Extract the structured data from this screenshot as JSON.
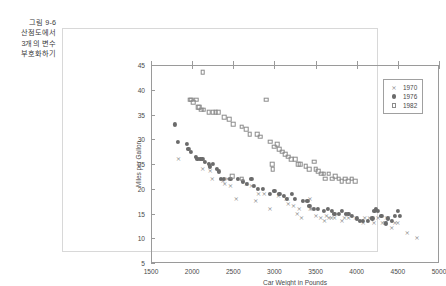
{
  "caption": {
    "lines": [
      "그림 9-6",
      "산점도에서",
      "3개의 변수",
      "부호화하기"
    ]
  },
  "colors": {
    "marker_1970": "#8b8b8b",
    "marker_1976": "#6b6b6b",
    "marker_1982": "#8b8b8b",
    "axis": "#9a9a9a",
    "frame": "#d8d8d8",
    "text": "#4a4a4a",
    "background": "#ffffff"
  },
  "legend": {
    "position": "top-right",
    "entries": [
      {
        "label": "1970",
        "marker": "cross-icon"
      },
      {
        "label": "1976",
        "marker": "filled-circle-icon"
      },
      {
        "label": "1982",
        "marker": "open-square-icon"
      }
    ]
  },
  "chart_data": {
    "type": "scatter",
    "title": "",
    "xlabel": "Car Weight in Pounds",
    "ylabel": "Miles per Gallon",
    "xlim": [
      1500,
      5000
    ],
    "ylim": [
      5,
      45
    ],
    "xticks": [
      1500,
      2000,
      2500,
      3000,
      3500,
      4000,
      4500,
      5000
    ],
    "yticks": [
      5,
      10,
      15,
      20,
      25,
      30,
      35,
      40,
      45
    ],
    "grid": false,
    "legend_position": "top-right",
    "series": [
      {
        "name": "1970",
        "marker": "cross-icon",
        "color": "#8b8b8b",
        "points": [
          [
            1835,
            26.0
          ],
          [
            2130,
            24.0
          ],
          [
            2220,
            23.5
          ],
          [
            2245,
            22.0
          ],
          [
            2375,
            21.5
          ],
          [
            2395,
            21.0
          ],
          [
            2425,
            22.0
          ],
          [
            2465,
            20.5
          ],
          [
            2535,
            18.0
          ],
          [
            2660,
            21.0
          ],
          [
            2720,
            20.5
          ],
          [
            2774,
            17.5
          ],
          [
            2807,
            19.0
          ],
          [
            2875,
            19.0
          ],
          [
            2945,
            16.0
          ],
          [
            3050,
            18.5
          ],
          [
            3139,
            18.0
          ],
          [
            3160,
            18.0
          ],
          [
            3169,
            17.0
          ],
          [
            3233,
            16.5
          ],
          [
            3278,
            15.0
          ],
          [
            3302,
            16.0
          ],
          [
            3329,
            14.0
          ],
          [
            3433,
            18.0
          ],
          [
            3436,
            16.0
          ],
          [
            3449,
            16.0
          ],
          [
            3504,
            14.5
          ],
          [
            3563,
            14.0
          ],
          [
            3609,
            13.5
          ],
          [
            3632,
            14.5
          ],
          [
            3664,
            14.0
          ],
          [
            3693,
            14.0
          ],
          [
            3730,
            14.0
          ],
          [
            3821,
            13.5
          ],
          [
            3850,
            14.0
          ],
          [
            3900,
            14.0
          ],
          [
            3988,
            14.0
          ],
          [
            4080,
            13.0
          ],
          [
            4096,
            14.0
          ],
          [
            4154,
            14.0
          ],
          [
            4209,
            13.0
          ],
          [
            4257,
            14.0
          ],
          [
            4312,
            13.0
          ],
          [
            4341,
            13.0
          ],
          [
            4354,
            13.0
          ],
          [
            4363,
            14.0
          ],
          [
            4385,
            14.0
          ],
          [
            4425,
            12.0
          ],
          [
            4464,
            13.0
          ],
          [
            4498,
            13.0
          ],
          [
            4615,
            11.0
          ],
          [
            4732,
            10.0
          ]
        ]
      },
      {
        "name": "1976",
        "marker": "filled-circle-icon",
        "color": "#6b6b6b",
        "points": [
          [
            1795,
            33.0
          ],
          [
            1825,
            29.5
          ],
          [
            1940,
            29.0
          ],
          [
            1955,
            28.0
          ],
          [
            1985,
            27.5
          ],
          [
            2045,
            26.5
          ],
          [
            2065,
            26.0
          ],
          [
            2100,
            26.0
          ],
          [
            2125,
            26.0
          ],
          [
            2155,
            25.5
          ],
          [
            2205,
            25.0
          ],
          [
            2220,
            24.5
          ],
          [
            2255,
            25.0
          ],
          [
            2300,
            24.0
          ],
          [
            2330,
            23.5
          ],
          [
            2350,
            22.0
          ],
          [
            2385,
            22.0
          ],
          [
            2465,
            22.0
          ],
          [
            2560,
            22.0
          ],
          [
            2620,
            21.5
          ],
          [
            2665,
            21.0
          ],
          [
            2720,
            22.0
          ],
          [
            2755,
            20.5
          ],
          [
            2800,
            20.0
          ],
          [
            2860,
            20.0
          ],
          [
            2945,
            19.0
          ],
          [
            3000,
            19.5
          ],
          [
            3060,
            19.0
          ],
          [
            3120,
            18.5
          ],
          [
            3155,
            18.0
          ],
          [
            3210,
            19.0
          ],
          [
            3250,
            18.0
          ],
          [
            3350,
            17.5
          ],
          [
            3400,
            17.5
          ],
          [
            3425,
            16.5
          ],
          [
            3475,
            16.0
          ],
          [
            3530,
            16.0
          ],
          [
            3605,
            15.5
          ],
          [
            3650,
            16.0
          ],
          [
            3700,
            15.5
          ],
          [
            3730,
            15.0
          ],
          [
            3785,
            15.0
          ],
          [
            3820,
            15.5
          ],
          [
            3870,
            15.0
          ],
          [
            3900,
            15.0
          ],
          [
            3940,
            14.5
          ],
          [
            4000,
            14.0
          ],
          [
            4042,
            13.5
          ],
          [
            4080,
            13.5
          ],
          [
            4135,
            13.5
          ],
          [
            4190,
            14.0
          ],
          [
            4215,
            15.5
          ],
          [
            4237,
            16.0
          ],
          [
            4260,
            15.5
          ],
          [
            4300,
            14.5
          ],
          [
            4354,
            13.0
          ],
          [
            4380,
            14.0
          ],
          [
            4425,
            13.5
          ],
          [
            4464,
            14.5
          ],
          [
            4499,
            15.5
          ],
          [
            4520,
            14.5
          ]
        ]
      },
      {
        "name": "1982",
        "marker": "open-square-icon",
        "color": "#8b8b8b",
        "points": [
          [
            2130,
            43.5
          ],
          [
            1975,
            38.0
          ],
          [
            1990,
            38.0
          ],
          [
            2010,
            37.5
          ],
          [
            2050,
            38.0
          ],
          [
            2075,
            36.5
          ],
          [
            2085,
            36.5
          ],
          [
            2110,
            36.0
          ],
          [
            2140,
            36.0
          ],
          [
            2200,
            35.5
          ],
          [
            2250,
            35.5
          ],
          [
            2285,
            35.5
          ],
          [
            2320,
            35.5
          ],
          [
            2390,
            34.5
          ],
          [
            2450,
            34.0
          ],
          [
            2500,
            33.0
          ],
          [
            2600,
            32.5
          ],
          [
            2655,
            32.0
          ],
          [
            2700,
            31.0
          ],
          [
            2790,
            31.0
          ],
          [
            2830,
            30.5
          ],
          [
            2900,
            38.0
          ],
          [
            2950,
            29.5
          ],
          [
            3000,
            28.5
          ],
          [
            3035,
            29.0
          ],
          [
            3060,
            28.0
          ],
          [
            3095,
            27.5
          ],
          [
            3130,
            27.0
          ],
          [
            3165,
            26.5
          ],
          [
            3205,
            26.0
          ],
          [
            3250,
            26.0
          ],
          [
            3290,
            25.0
          ],
          [
            3310,
            25.0
          ],
          [
            3380,
            24.5
          ],
          [
            3420,
            24.0
          ],
          [
            3480,
            25.5
          ],
          [
            3500,
            24.0
          ],
          [
            3530,
            23.5
          ],
          [
            3570,
            23.0
          ],
          [
            3600,
            23.0
          ],
          [
            3620,
            22.0
          ],
          [
            3660,
            23.0
          ],
          [
            3700,
            22.0
          ],
          [
            3740,
            22.5
          ],
          [
            3780,
            22.0
          ],
          [
            3820,
            21.5
          ],
          [
            3860,
            22.0
          ],
          [
            3900,
            21.5
          ],
          [
            3940,
            22.0
          ],
          [
            3980,
            21.5
          ],
          [
            2975,
            25.0
          ],
          [
            2485,
            22.5
          ],
          [
            2600,
            22.0
          ],
          [
            2980,
            24.0
          ]
        ]
      }
    ]
  }
}
